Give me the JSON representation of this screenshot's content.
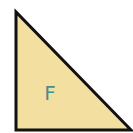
{
  "diagram": {
    "shape": "right-triangle",
    "label": "F",
    "vertices": [
      [
        16,
        12
      ],
      [
        16,
        130
      ],
      [
        131,
        130
      ]
    ],
    "colors": {
      "fill": "#F3DFA0",
      "stroke": "#111111",
      "label": "#4A8C8F",
      "background": "#FFFFFF"
    },
    "stroke_width": 3,
    "label_position": [
      50,
      100
    ]
  }
}
